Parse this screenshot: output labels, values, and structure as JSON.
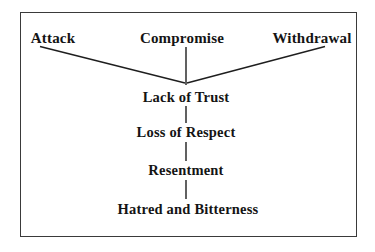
{
  "diagram": {
    "type": "flow-convergence-chain",
    "background_color": "#ffffff",
    "border_color": "#3a3a3a",
    "text_color": "#141414",
    "line_color": "#1e1e1e",
    "nodes": {
      "attack": "Attack",
      "compromise": "Compromise",
      "withdrawal": "Withdrawal",
      "lack_of_trust": "Lack of Trust",
      "loss_of_respect": "Loss of Respect",
      "resentment": "Resentment",
      "hatred_and_bitterness": "Hatred and Bitterness"
    },
    "edges": [
      {
        "from": "attack",
        "to": "lack_of_trust",
        "style": "diagonal"
      },
      {
        "from": "compromise",
        "to": "lack_of_trust",
        "style": "vertical"
      },
      {
        "from": "withdrawal",
        "to": "lack_of_trust",
        "style": "diagonal"
      },
      {
        "from": "lack_of_trust",
        "to": "loss_of_respect",
        "style": "vertical"
      },
      {
        "from": "loss_of_respect",
        "to": "resentment",
        "style": "vertical"
      },
      {
        "from": "resentment",
        "to": "hatred_and_bitterness",
        "style": "vertical"
      }
    ]
  }
}
